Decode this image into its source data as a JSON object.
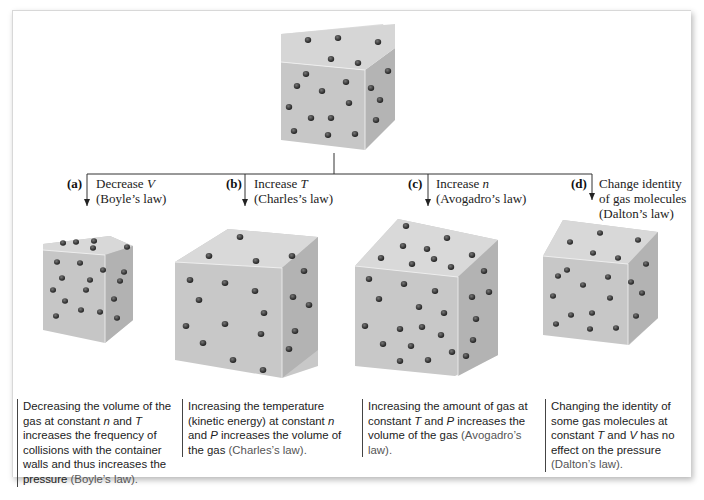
{
  "figure": {
    "top_cube": {
      "name": "initial-gas-container"
    },
    "branches": [
      {
        "tag": "(a)",
        "change_pre": "Decrease ",
        "change_var": "V",
        "law_label": "(Boyle’s law)",
        "desc": [
          {
            "t": "Decreasing the volume of the gas at constant "
          },
          {
            "v": "n"
          },
          {
            "t": " and "
          },
          {
            "v": "T"
          },
          {
            "t": " increases the frequency of collisions with the container walls and thus increases the pressure "
          },
          {
            "b": "(Boyle’s law)."
          }
        ]
      },
      {
        "tag": "(b)",
        "change_pre": "Increase ",
        "change_var": "T",
        "law_label": "(Charles’s law)",
        "desc": [
          {
            "t": "Increasing the temperature (kinetic energy) at constant "
          },
          {
            "v": "n"
          },
          {
            "t": " and "
          },
          {
            "v": "P"
          },
          {
            "t": " increases the volume of the gas "
          },
          {
            "b": "(Charles’s law)."
          }
        ]
      },
      {
        "tag": "(c)",
        "change_pre": "Increase ",
        "change_var": "n",
        "law_label": "(Avogadro’s law)",
        "desc": [
          {
            "t": "Increasing the amount of gas at constant "
          },
          {
            "v": "T"
          },
          {
            "t": " and "
          },
          {
            "v": "P"
          },
          {
            "t": " increases the volume of the gas "
          },
          {
            "b": "(Avogadro’s law)."
          }
        ]
      },
      {
        "tag": "(d)",
        "change_pre": "Change identity of gas molecules",
        "change_var": "",
        "law_label": "(Dalton’s law)",
        "desc": [
          {
            "t": "Changing the identity of some gas molecules at constant "
          },
          {
            "v": "T"
          },
          {
            "t": " and "
          },
          {
            "v": "V"
          },
          {
            "t": " has no effect on the pressure "
          },
          {
            "b": "(Dalton’s law)."
          }
        ]
      }
    ],
    "colors": {
      "line": "#333333",
      "cube_front": "#c9c9c9",
      "cube_top": "#dedede",
      "cube_side": "#b5b5b5",
      "molecule": "#2e2e2e"
    }
  }
}
